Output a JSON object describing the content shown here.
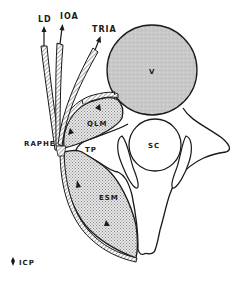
{
  "diagram": {
    "labels": {
      "ld": "LD",
      "ioa": "IOA",
      "tria": "TRIA",
      "vertebral_body": "V",
      "qlm": "QLM",
      "raphe": "RAPHE",
      "tp": "TP",
      "sc": "SC",
      "esm": "ESM"
    },
    "legend": {
      "symbol": "icp-arrowhead",
      "label": "ICP"
    },
    "colors": {
      "stroke": "#1a1a1a",
      "vertebral_body_fill": "#c8c8c8",
      "muscle_fill": "#d9d9d9",
      "background": "#ffffff"
    }
  }
}
